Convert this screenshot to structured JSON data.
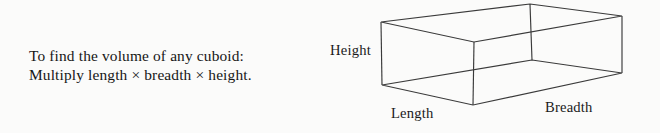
{
  "page": {
    "background_color": "#fbfbfa",
    "ink_color": "#1a1a1a"
  },
  "explanation": {
    "line1": "To find the volume of any cuboid:",
    "line2": "Multiply length × breadth × height."
  },
  "diagram": {
    "shape_name": "cuboid-wireframe",
    "stroke_color": "#3a3a3a",
    "labels": {
      "height": "Height",
      "length": "Length",
      "breadth": "Breadth"
    },
    "vertices": {
      "front_top_left": [
        381,
        22
      ],
      "front_bottom_left": [
        382,
        85
      ],
      "front_top_near": [
        474,
        42
      ],
      "front_bottom_near": [
        473,
        105
      ],
      "back_top_apex": [
        530,
        4
      ],
      "back_bottom_apex": [
        532,
        60
      ],
      "right_top": [
        622,
        16
      ],
      "right_bottom": [
        622,
        73
      ]
    }
  }
}
